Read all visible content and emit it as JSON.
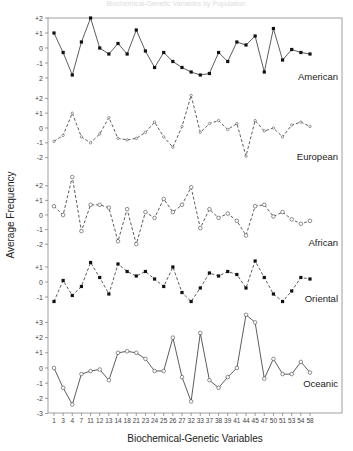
{
  "header": {
    "ghost_title": "Biochemical-Genetic Variables by Population"
  },
  "chart_data": {
    "type": "line",
    "title": "",
    "xlabel": "Biochemical-Genetic Variables",
    "ylabel": "Average Frequency",
    "categories": [
      "1",
      "3",
      "4",
      "7",
      "11",
      "12",
      "13",
      "14",
      "18",
      "21",
      "23",
      "24",
      "25",
      "26",
      "27",
      "32",
      "33",
      "37",
      "38",
      "39",
      "41",
      "44",
      "45",
      "47",
      "50",
      "51",
      "53",
      "54",
      "58"
    ],
    "grid": false,
    "panels": [
      {
        "name": "American",
        "line_style": "solid",
        "marker": "filled",
        "y_ticks": [
          "+2",
          "+1",
          "0",
          "-1",
          "2"
        ],
        "ylim": [
          -2,
          2
        ],
        "values": [
          1.0,
          -0.3,
          -1.8,
          0.4,
          2.0,
          0.0,
          -0.4,
          0.3,
          -0.4,
          1.2,
          -0.2,
          -1.3,
          -0.3,
          -0.9,
          -1.3,
          -1.6,
          -1.8,
          -1.7,
          -0.3,
          -0.9,
          0.4,
          0.2,
          0.8,
          -1.6,
          1.3,
          -0.8,
          -0.1,
          -0.3,
          -0.4
        ]
      },
      {
        "name": "European",
        "line_style": "dashed",
        "marker": "open-small",
        "y_ticks": [
          "+2",
          "+1",
          "0",
          "-1",
          "-2"
        ],
        "ylim": [
          -2,
          2
        ],
        "values": [
          -0.9,
          -0.5,
          1.0,
          -0.6,
          -1.0,
          -0.4,
          0.7,
          -0.7,
          -0.8,
          -0.7,
          -0.3,
          0.4,
          -0.6,
          -1.3,
          0.1,
          2.2,
          -0.3,
          0.3,
          0.5,
          -0.1,
          0.3,
          -1.9,
          0.5,
          -0.2,
          0.0,
          -0.6,
          0.2,
          0.4,
          0.1
        ]
      },
      {
        "name": "African",
        "line_style": "dashed",
        "marker": "open",
        "y_ticks": [
          "+2",
          "+1",
          "0",
          "-1",
          "-2"
        ],
        "ylim": [
          -2,
          3
        ],
        "values": [
          0.6,
          0.0,
          2.6,
          -1.1,
          0.7,
          0.7,
          0.5,
          -1.8,
          0.4,
          -2.0,
          0.2,
          -0.2,
          1.1,
          0.2,
          0.7,
          1.9,
          -0.9,
          0.4,
          -0.2,
          0.1,
          -0.4,
          -1.4,
          0.6,
          0.7,
          -0.1,
          0.2,
          -0.3,
          -0.6,
          -0.4
        ]
      },
      {
        "name": "Oriental",
        "line_style": "dashed",
        "marker": "filled",
        "y_ticks": [
          "+1",
          "0",
          "-1"
        ],
        "ylim": [
          -1.5,
          1.5
        ],
        "values": [
          -1.3,
          0.1,
          -0.9,
          -0.3,
          1.3,
          0.3,
          -0.8,
          1.2,
          0.7,
          0.4,
          0.7,
          0.2,
          -0.3,
          1.0,
          -0.7,
          -1.3,
          -0.4,
          0.6,
          0.4,
          0.7,
          0.5,
          -0.4,
          1.4,
          0.3,
          -0.8,
          -1.3,
          -0.6,
          0.3,
          0.2
        ]
      },
      {
        "name": "Oceanic",
        "line_style": "solid",
        "marker": "open",
        "y_ticks": [
          "+3",
          "+2",
          "+1",
          "0",
          "-1",
          "-2",
          "-3"
        ],
        "ylim": [
          -3,
          3
        ],
        "values": [
          0.0,
          -1.3,
          -2.4,
          -0.4,
          -0.2,
          -0.1,
          -0.8,
          1.0,
          1.1,
          1.0,
          0.6,
          -0.2,
          -0.2,
          2.0,
          -0.6,
          -2.2,
          2.3,
          -0.8,
          -1.3,
          -0.6,
          0.0,
          3.5,
          3.0,
          -0.7,
          0.6,
          -0.4,
          -0.4,
          0.4,
          -0.3
        ]
      }
    ]
  }
}
